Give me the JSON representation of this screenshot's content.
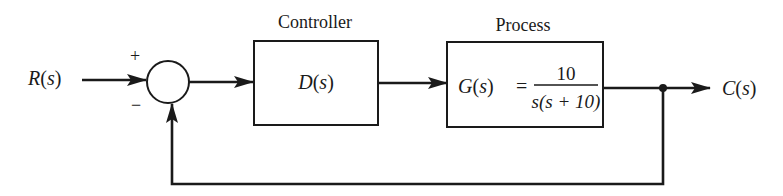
{
  "diagram": {
    "type": "feedback-control-block-diagram",
    "input": {
      "label": "R(s)",
      "label_parts": [
        "R",
        "(",
        "s",
        ")"
      ]
    },
    "output": {
      "label": "C(s)",
      "label_parts": [
        "C",
        "(",
        "s",
        ")"
      ]
    },
    "summing_junction": {
      "plus_sign": "+",
      "minus_sign": "−"
    },
    "controller": {
      "title": "Controller",
      "transfer_function": "D(s)",
      "tf_parts": [
        "D",
        "(",
        "s",
        ")"
      ]
    },
    "process": {
      "title": "Process",
      "transfer_function": "G(s) = 10 / (s(s + 10))",
      "lhs_parts": [
        "G",
        "(",
        "s",
        ")"
      ],
      "equals": "=",
      "numerator": "10",
      "denominator": "s(s + 10)"
    },
    "feedback": {
      "type": "unity negative feedback"
    }
  }
}
